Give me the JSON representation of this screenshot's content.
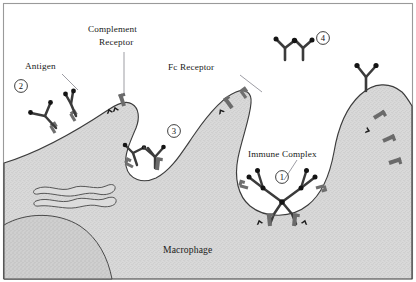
{
  "figure": {
    "border_color": "#9a9a9a",
    "background_color": "#ffffff",
    "cytoplasm_color": "#d8d8d8",
    "receptor_color": "#6e6e6e",
    "antibody_color": "#3a3a3a",
    "antigen_color": "#151515"
  },
  "labels": {
    "antigen": "Antigen",
    "complement_receptor_line1": "Complement",
    "complement_receptor_line2": "Receptor",
    "fc_receptor": "Fc Receptor",
    "immune_complex": "Immune Complex",
    "macrophage": "Macrophage"
  },
  "callouts": [
    {
      "id": "1",
      "label": "1",
      "cx": 282,
      "cy": 177,
      "r": 6.4
    },
    {
      "id": "2",
      "label": "2",
      "cx": 21,
      "cy": 86,
      "r": 6.4
    },
    {
      "id": "3",
      "label": "3",
      "cx": 174,
      "cy": 131,
      "r": 6.4
    },
    {
      "id": "4",
      "label": "4",
      "cx": 323,
      "cy": 38,
      "r": 6.4
    }
  ],
  "stages": [
    {
      "number": "4",
      "description": "Free antibody and antigen in solution"
    },
    {
      "number": "2",
      "description": "Antibody-coated antigen binding surface receptors"
    },
    {
      "number": "3",
      "description": "Partially engulfed complex in forming phagosome"
    },
    {
      "number": "1",
      "description": "Immune complex internalized in phagocytic cup"
    }
  ]
}
